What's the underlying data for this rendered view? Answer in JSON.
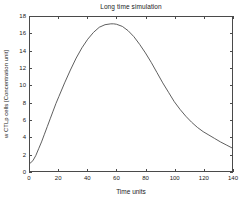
{
  "chart_data": {
    "type": "line",
    "title": "Long time simulation",
    "xlabel": "Time units",
    "ylabel": "w CTLp cells  [Concentration unit]",
    "xlim": [
      0,
      140
    ],
    "ylim": [
      0,
      18
    ],
    "grid": false,
    "legend": null,
    "xticks": [
      0,
      20,
      40,
      60,
      80,
      100,
      120,
      140
    ],
    "xticklabels": [
      "0",
      "20",
      "40",
      "60",
      "80",
      "100",
      "120",
      "140"
    ],
    "yticks": [
      0,
      2,
      4,
      6,
      8,
      10,
      12,
      14,
      16,
      18
    ],
    "yticklabels": [
      "0",
      "2",
      "4",
      "6",
      "8",
      "10",
      "12",
      "14",
      "16",
      "18"
    ],
    "series": [
      {
        "name": "w CTLp cells",
        "color": "#4a4a4a",
        "x": [
          0,
          2,
          4,
          6,
          8,
          10,
          12,
          14,
          16,
          18,
          20,
          24,
          28,
          32,
          36,
          40,
          44,
          48,
          52,
          56,
          58,
          60,
          64,
          68,
          72,
          76,
          80,
          84,
          88,
          92,
          96,
          100,
          104,
          108,
          112,
          116,
          120,
          124,
          128,
          132,
          136,
          140
        ],
        "y": [
          0.9,
          1.2,
          1.8,
          2.6,
          3.4,
          4.3,
          5.2,
          6.1,
          7.0,
          7.9,
          8.7,
          10.3,
          11.8,
          13.2,
          14.4,
          15.4,
          16.2,
          16.8,
          17.1,
          17.2,
          17.2,
          17.15,
          16.9,
          16.4,
          15.7,
          14.8,
          13.8,
          12.7,
          11.5,
          10.3,
          9.2,
          8.1,
          7.2,
          6.4,
          5.7,
          5.1,
          4.6,
          4.2,
          3.8,
          3.4,
          3.05,
          2.7
        ]
      }
    ]
  }
}
